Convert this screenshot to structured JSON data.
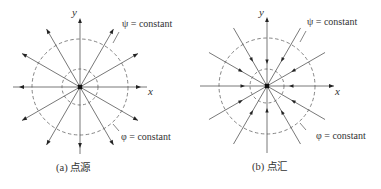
{
  "figure": {
    "panels": [
      {
        "id": "a",
        "caption": "(a) 点源",
        "center": [
          80,
          87
        ],
        "outer_radius": 48,
        "inner_radius": 18,
        "ray_length": 67,
        "ray_angles_deg": [
          0,
          30,
          60,
          90,
          120,
          150,
          180,
          210,
          240,
          270,
          300,
          330
        ],
        "arrow_direction": "outward",
        "labels": {
          "x_axis": "x",
          "y_axis": "y",
          "streamline": "ψ = constant",
          "potential": "φ = constant"
        }
      },
      {
        "id": "b",
        "caption": "(b) 点汇",
        "center": [
          267,
          86
        ],
        "outer_radius": 48,
        "inner_radius": 17,
        "ray_length": 67,
        "ray_angles_deg": [
          0,
          30,
          60,
          90,
          120,
          150,
          180,
          210,
          240,
          270,
          300,
          330
        ],
        "arrow_direction": "inward",
        "labels": {
          "x_axis": "x",
          "y_axis": "y",
          "streamline": "ψ = constant",
          "potential": "φ = constant"
        }
      }
    ],
    "colors": {
      "line": "#555555",
      "dashed": "#666666",
      "arrow": "#222222",
      "text": "#333333"
    }
  }
}
